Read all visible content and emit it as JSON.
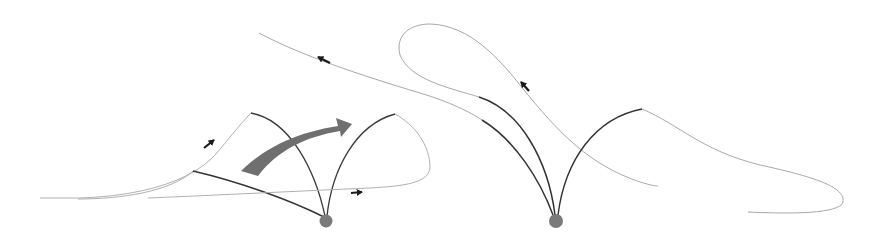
{
  "diagram": {
    "colors": {
      "background": "#ffffff",
      "thin_line": "#a8a8a8",
      "dark_line": "#3a3a3a",
      "pivot": "#7a7a7a",
      "big_arrow": "#6f6f6f",
      "small_arrow": "#1a1a1a"
    },
    "left_panel": {
      "pivot": {
        "cx": 326,
        "cy": 221,
        "r": 6.5
      },
      "direction_arrows": 2
    },
    "right_panel": {
      "pivot": {
        "cx": 556,
        "cy": 221,
        "r": 7
      },
      "direction_arrows": 2
    },
    "transition_arrow": {
      "from": [
        245,
        175
      ],
      "to": [
        352,
        122
      ]
    }
  }
}
